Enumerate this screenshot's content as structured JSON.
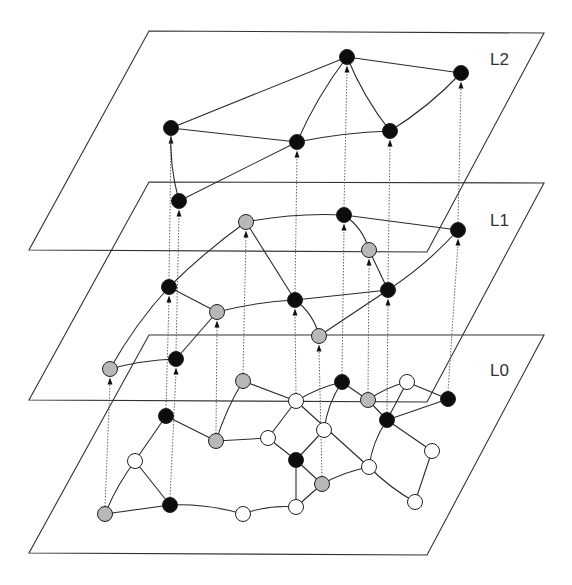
{
  "colors": {
    "black": "#0d0d0d",
    "gray": "#b8b8b8",
    "white": "#ffffff"
  },
  "levels": [
    {
      "id": "L2",
      "label": "L2",
      "plane": [
        [
          149,
          31
        ],
        [
          544,
          33
        ],
        [
          427,
          252
        ],
        [
          29,
          250
        ]
      ],
      "label_pos": [
        490,
        65
      ]
    },
    {
      "id": "L1",
      "label": "L1",
      "plane": [
        [
          149,
          182
        ],
        [
          544,
          183
        ],
        [
          427,
          402
        ],
        [
          29,
          400
        ]
      ],
      "label_pos": [
        490,
        226
      ]
    },
    {
      "id": "L0",
      "label": "L0",
      "plane": [
        [
          149,
          335
        ],
        [
          544,
          335
        ],
        [
          427,
          555
        ],
        [
          29,
          553
        ]
      ],
      "label_pos": [
        490,
        376
      ]
    }
  ],
  "nodes": [
    {
      "id": "a1",
      "level": "L2",
      "x": 171,
      "y": 128,
      "fill": "black"
    },
    {
      "id": "a2",
      "level": "L2",
      "x": 297,
      "y": 142,
      "fill": "black"
    },
    {
      "id": "a3",
      "level": "L2",
      "x": 347,
      "y": 57,
      "fill": "black"
    },
    {
      "id": "a4",
      "level": "L2",
      "x": 390,
      "y": 131,
      "fill": "black"
    },
    {
      "id": "a5",
      "level": "L2",
      "x": 461,
      "y": 73,
      "fill": "black"
    },
    {
      "id": "b1",
      "level": "L1",
      "x": 179,
      "y": 201,
      "fill": "black"
    },
    {
      "id": "b2",
      "level": "L1",
      "x": 246,
      "y": 222,
      "fill": "gray"
    },
    {
      "id": "b3",
      "level": "L1",
      "x": 344,
      "y": 215,
      "fill": "black"
    },
    {
      "id": "b4",
      "level": "L1",
      "x": 458,
      "y": 230,
      "fill": "black"
    },
    {
      "id": "b5",
      "level": "L1",
      "x": 369,
      "y": 250,
      "fill": "gray"
    },
    {
      "id": "b6",
      "level": "L1",
      "x": 169,
      "y": 287,
      "fill": "black"
    },
    {
      "id": "b7",
      "level": "L1",
      "x": 217,
      "y": 312,
      "fill": "gray"
    },
    {
      "id": "b8",
      "level": "L1",
      "x": 295,
      "y": 300,
      "fill": "black"
    },
    {
      "id": "b9",
      "level": "L1",
      "x": 388,
      "y": 290,
      "fill": "black"
    },
    {
      "id": "b10",
      "level": "L1",
      "x": 319,
      "y": 336,
      "fill": "gray"
    },
    {
      "id": "b11",
      "level": "L1",
      "x": 110,
      "y": 369,
      "fill": "gray"
    },
    {
      "id": "b12",
      "level": "L1",
      "x": 176,
      "y": 359,
      "fill": "black"
    },
    {
      "id": "c1",
      "level": "L0",
      "x": 243,
      "y": 381,
      "fill": "gray"
    },
    {
      "id": "c2",
      "level": "L0",
      "x": 296,
      "y": 401,
      "fill": "white"
    },
    {
      "id": "c3",
      "level": "L0",
      "x": 342,
      "y": 382,
      "fill": "black"
    },
    {
      "id": "c4",
      "level": "L0",
      "x": 368,
      "y": 400,
      "fill": "gray"
    },
    {
      "id": "c5",
      "level": "L0",
      "x": 407,
      "y": 382,
      "fill": "white"
    },
    {
      "id": "c6",
      "level": "L0",
      "x": 448,
      "y": 399,
      "fill": "black"
    },
    {
      "id": "c7",
      "level": "L0",
      "x": 387,
      "y": 420,
      "fill": "black"
    },
    {
      "id": "c8",
      "level": "L0",
      "x": 166,
      "y": 416,
      "fill": "black"
    },
    {
      "id": "c9",
      "level": "L0",
      "x": 216,
      "y": 441,
      "fill": "gray"
    },
    {
      "id": "c10",
      "level": "L0",
      "x": 268,
      "y": 438,
      "fill": "white"
    },
    {
      "id": "c11",
      "level": "L0",
      "x": 324,
      "y": 430,
      "fill": "white"
    },
    {
      "id": "c12",
      "level": "L0",
      "x": 432,
      "y": 451,
      "fill": "white"
    },
    {
      "id": "c13",
      "level": "L0",
      "x": 135,
      "y": 461,
      "fill": "white"
    },
    {
      "id": "c14",
      "level": "L0",
      "x": 296,
      "y": 460,
      "fill": "black"
    },
    {
      "id": "c15",
      "level": "L0",
      "x": 369,
      "y": 467,
      "fill": "white"
    },
    {
      "id": "c16",
      "level": "L0",
      "x": 322,
      "y": 484,
      "fill": "gray"
    },
    {
      "id": "c17",
      "level": "L0",
      "x": 105,
      "y": 514,
      "fill": "gray"
    },
    {
      "id": "c18",
      "level": "L0",
      "x": 170,
      "y": 505,
      "fill": "black"
    },
    {
      "id": "c19",
      "level": "L0",
      "x": 243,
      "y": 514,
      "fill": "white"
    },
    {
      "id": "c20",
      "level": "L0",
      "x": 296,
      "y": 507,
      "fill": "white"
    },
    {
      "id": "c21",
      "level": "L0",
      "x": 415,
      "y": 502,
      "fill": "white"
    }
  ],
  "edges": [
    [
      "a1",
      "a3",
      0
    ],
    [
      "a3",
      "a5",
      0
    ],
    [
      "a1",
      "a2",
      0
    ],
    [
      "a2",
      "a4",
      -4
    ],
    [
      "a2",
      "a3",
      -6
    ],
    [
      "a3",
      "a4",
      6
    ],
    [
      "a4",
      "a5",
      6
    ],
    [
      "b1",
      "a2",
      0
    ],
    [
      "b1",
      "a1",
      -6
    ],
    [
      "b2",
      "b3",
      -6
    ],
    [
      "b3",
      "b4",
      0
    ],
    [
      "b3",
      "b5",
      -8
    ],
    [
      "b2",
      "b6",
      4
    ],
    [
      "b2",
      "b8",
      0
    ],
    [
      "b6",
      "b7",
      0
    ],
    [
      "b7",
      "b8",
      -4
    ],
    [
      "b8",
      "b9",
      0
    ],
    [
      "b8",
      "b10",
      -8
    ],
    [
      "b10",
      "b9",
      0
    ],
    [
      "b5",
      "b9",
      0
    ],
    [
      "b9",
      "b4",
      6
    ],
    [
      "b6",
      "b11",
      6
    ],
    [
      "b11",
      "b12",
      -4
    ],
    [
      "b12",
      "b7",
      0
    ],
    [
      "c1",
      "c2",
      0
    ],
    [
      "c2",
      "c3",
      -4
    ],
    [
      "c3",
      "c4",
      0
    ],
    [
      "c4",
      "c5",
      -4
    ],
    [
      "c5",
      "c6",
      0
    ],
    [
      "c4",
      "c7",
      0
    ],
    [
      "c5",
      "c7",
      0
    ],
    [
      "c6",
      "c7",
      0
    ],
    [
      "c1",
      "c9",
      4
    ],
    [
      "c8",
      "c9",
      0
    ],
    [
      "c9",
      "c10",
      0
    ],
    [
      "c10",
      "c14",
      0
    ],
    [
      "c2",
      "c10",
      0
    ],
    [
      "c2",
      "c15",
      0
    ],
    [
      "c3",
      "c11",
      6
    ],
    [
      "c11",
      "c14",
      0
    ],
    [
      "c14",
      "c16",
      0
    ],
    [
      "c14",
      "c20",
      0
    ],
    [
      "c16",
      "c15",
      -4
    ],
    [
      "c15",
      "c7",
      -6
    ],
    [
      "c7",
      "c12",
      0
    ],
    [
      "c12",
      "c21",
      0
    ],
    [
      "c15",
      "c21",
      4
    ],
    [
      "c16",
      "c20",
      0
    ],
    [
      "c8",
      "c13",
      0
    ],
    [
      "c13",
      "c17",
      4
    ],
    [
      "c13",
      "c18",
      0
    ],
    [
      "c17",
      "c18",
      0
    ],
    [
      "c18",
      "c19",
      -6
    ],
    [
      "c19",
      "c20",
      -6
    ]
  ],
  "links": [
    [
      "c17",
      "b11"
    ],
    [
      "c8",
      "b6"
    ],
    [
      "c18",
      "b12"
    ],
    [
      "c9",
      "b7"
    ],
    [
      "c1",
      "b2"
    ],
    [
      "c2",
      "b8"
    ],
    [
      "c16",
      "b10"
    ],
    [
      "c3",
      "b3"
    ],
    [
      "c4",
      "b5"
    ],
    [
      "c7",
      "b9"
    ],
    [
      "c6",
      "b4"
    ],
    [
      "b6",
      "a1"
    ],
    [
      "b12",
      "b1"
    ],
    [
      "b8",
      "a2"
    ],
    [
      "b3",
      "a3"
    ],
    [
      "b9",
      "a4"
    ],
    [
      "b4",
      "a5"
    ]
  ]
}
